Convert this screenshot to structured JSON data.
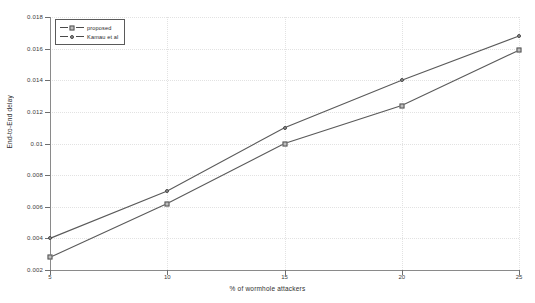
{
  "chart_data": {
    "type": "line",
    "title": "",
    "xlabel": "% of wormhole attackers",
    "ylabel": "End-to-End delay",
    "x": [
      5,
      10,
      15,
      20,
      25
    ],
    "xlim": [
      5,
      25
    ],
    "ylim": [
      0.002,
      0.018
    ],
    "xticks": [
      "5",
      "10",
      "15",
      "20",
      "25"
    ],
    "yticks": [
      "0.002",
      "0.004",
      "0.006",
      "0.008",
      "0.01",
      "0.012",
      "0.014",
      "0.016",
      "0.018"
    ],
    "grid": true,
    "legend_position": "top-left",
    "series": [
      {
        "name": "proposed",
        "marker": "square",
        "values": [
          0.0028,
          0.0062,
          0.01,
          0.0124,
          0.0159
        ]
      },
      {
        "name": "Kamau et al",
        "marker": "circle",
        "values": [
          0.004,
          0.007,
          0.011,
          0.014,
          0.0168
        ]
      }
    ]
  },
  "legend": {
    "entries": [
      {
        "label": "proposed"
      },
      {
        "label": "Kamau et al"
      }
    ]
  }
}
